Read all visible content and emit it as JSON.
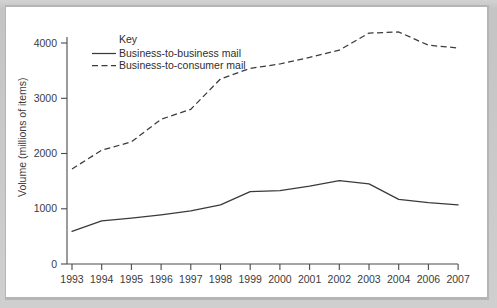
{
  "chart_data": {
    "type": "line",
    "title": "",
    "subtitle": "",
    "xlabel": "",
    "ylabel": "Volume (millions of items)",
    "categories": [
      "1993",
      "1994",
      "1995",
      "1996",
      "1997",
      "1998",
      "1999",
      "2000",
      "2001",
      "2002",
      "2003",
      "2004",
      "2006",
      "2007"
    ],
    "x": [
      1993,
      1994,
      1995,
      1996,
      1997,
      1998,
      1999,
      2000,
      2001,
      2002,
      2003,
      2004,
      2006,
      2007
    ],
    "series": [
      {
        "name": "Business-to-business mail",
        "style": "solid",
        "color": "#3a3a3a",
        "values": [
          590,
          780,
          830,
          890,
          960,
          1070,
          1310,
          1330,
          1410,
          1510,
          1450,
          1170,
          1110,
          1070
        ]
      },
      {
        "name": "Business-to-consumer mail",
        "style": "dashed",
        "color": "#3a3a3a",
        "values": [
          1720,
          2060,
          2210,
          2620,
          2800,
          3350,
          3540,
          3620,
          3740,
          3870,
          4180,
          4200,
          3960,
          3910
        ]
      }
    ],
    "ylim": [
      0,
      4400
    ],
    "yticks": [
      0,
      1000,
      2000,
      3000,
      4000
    ],
    "ytick_labels": [
      "0",
      "1000",
      "2000",
      "3000",
      "4000"
    ],
    "xtick_labels": [
      "1993",
      "1994",
      "1995",
      "1996",
      "1997",
      "1998",
      "1999",
      "2000",
      "2001",
      "2002",
      "2003",
      "2004",
      "2006",
      "2007"
    ],
    "grid": false,
    "legend": {
      "title": "Key",
      "position": "top-left-inside",
      "entries": [
        {
          "label": "Business-to-business mail",
          "style": "solid"
        },
        {
          "label": "Business-to-consumer mail",
          "style": "dashed"
        }
      ]
    }
  }
}
